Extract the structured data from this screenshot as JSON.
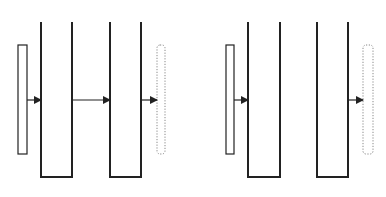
{
  "diagram": {
    "title": "",
    "stroke_color": "#222222",
    "dotted_color": "#888888",
    "background": "#ffffff",
    "panels": [
      {
        "name": "left-panel",
        "source_plate": {
          "x": 18,
          "y": 45,
          "w": 9,
          "h": 109,
          "style": "solid"
        },
        "channels": [
          {
            "x1": 41,
            "x2": 72,
            "top": 22,
            "bottom": 177
          },
          {
            "x1": 110,
            "x2": 141,
            "top": 22,
            "bottom": 177
          }
        ],
        "target_plate": {
          "x": 157,
          "y": 45,
          "w": 8,
          "h": 109,
          "style": "dotted"
        },
        "arrows": [
          {
            "from": 27,
            "to": 41,
            "y": 100
          },
          {
            "from": 72,
            "to": 110,
            "y": 100
          },
          {
            "from": 141,
            "to": 157,
            "y": 100
          }
        ]
      },
      {
        "name": "right-panel",
        "source_plate": {
          "x": 226,
          "y": 45,
          "w": 8,
          "h": 109,
          "style": "solid"
        },
        "channels": [
          {
            "x1": 248,
            "x2": 280,
            "top": 22,
            "bottom": 177
          },
          {
            "x1": 317,
            "x2": 348,
            "top": 22,
            "bottom": 177
          }
        ],
        "target_plate": {
          "x": 363,
          "y": 45,
          "w": 10,
          "h": 109,
          "style": "dotted"
        },
        "arrows": [
          {
            "from": 234,
            "to": 248,
            "y": 100
          },
          {
            "from": 348,
            "to": 363,
            "y": 100
          }
        ]
      }
    ]
  }
}
